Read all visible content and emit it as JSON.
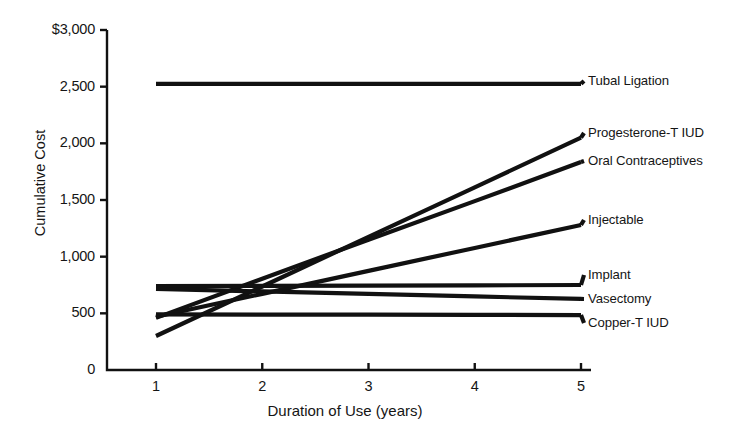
{
  "chart_data": {
    "type": "line",
    "title": "",
    "xlabel": "Duration of Use (years)",
    "ylabel": "Cumulative Cost",
    "x": [
      1,
      2,
      3,
      4,
      5
    ],
    "xlim": [
      1,
      5
    ],
    "ylim": [
      0,
      3000
    ],
    "grid": false,
    "legend_position": "right-inline-labels",
    "xticks": [
      "1",
      "2",
      "3",
      "4",
      "5"
    ],
    "yticks": [
      "$3,000",
      "2,500",
      "2,000",
      "1,500",
      "1,000",
      "500",
      "0"
    ],
    "ytick_values": [
      3000,
      2500,
      2000,
      1500,
      1000,
      500,
      0
    ],
    "series": [
      {
        "name": "Tubal Ligation",
        "values": [
          2525,
          2525,
          2525,
          2525,
          2525
        ],
        "label_value": 2525
      },
      {
        "name": "Progesterone-T IUD",
        "values": [
          300,
          737,
          1175,
          1612,
          2050
        ],
        "label_value": 2050
      },
      {
        "name": "Oral Contraceptives",
        "values": [
          460,
          805,
          1150,
          1490,
          1835
        ],
        "label_value": 1835
      },
      {
        "name": "Injectable",
        "values": [
          470,
          672,
          875,
          1077,
          1280
        ],
        "label_value": 1280
      },
      {
        "name": "Implant",
        "values": [
          740,
          742,
          745,
          747,
          750
        ],
        "label_value": 750
      },
      {
        "name": "Vasectomy",
        "values": [
          715,
          693,
          671,
          649,
          627
        ],
        "label_value": 627
      },
      {
        "name": "Copper-T IUD",
        "values": [
          490,
          489,
          488,
          487,
          485
        ],
        "label_value": 485
      }
    ]
  },
  "axis": {
    "y_ticks": [
      {
        "label": "$3,000",
        "value": 3000
      },
      {
        "label": "2,500",
        "value": 2500
      },
      {
        "label": "2,000",
        "value": 2000
      },
      {
        "label": "1,500",
        "value": 1500
      },
      {
        "label": "1,000",
        "value": 1000
      },
      {
        "label": "500",
        "value": 500
      },
      {
        "label": "0",
        "value": 0
      }
    ],
    "x_ticks": [
      {
        "label": "1",
        "value": 1
      },
      {
        "label": "2",
        "value": 2
      },
      {
        "label": "3",
        "value": 3
      },
      {
        "label": "4",
        "value": 4
      },
      {
        "label": "5",
        "value": 5
      }
    ],
    "x_title": "Duration of Use (years)",
    "y_title": "Cumulative Cost"
  },
  "style": {
    "line_color": "#111111",
    "axis_color": "#111111",
    "background": "#ffffff"
  }
}
